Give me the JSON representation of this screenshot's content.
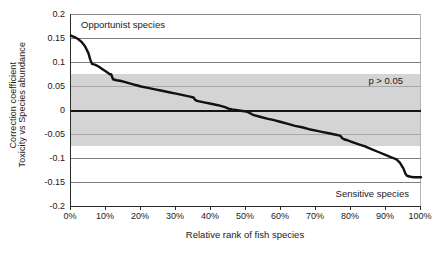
{
  "chart_data": {
    "type": "line",
    "title": "",
    "xlabel": "Relative rank of fish species",
    "ylabel_line1": "Correction coefficient",
    "ylabel_line2": "Toxicity vs Species abundance",
    "xlim": [
      0,
      100
    ],
    "ylim": [
      -0.2,
      0.2
    ],
    "x_ticks": [
      0,
      10,
      20,
      30,
      40,
      50,
      60,
      70,
      80,
      90,
      100
    ],
    "x_tick_labels": [
      "0%",
      "10%",
      "20%",
      "30%",
      "40%",
      "50%",
      "60%",
      "70%",
      "80%",
      "90%",
      "100%"
    ],
    "y_ticks": [
      0.2,
      0.15,
      0.1,
      0.05,
      0,
      -0.05,
      -0.1,
      -0.15,
      -0.2
    ],
    "y_tick_labels": [
      "0.2",
      "0.15",
      "0.1",
      "0.05",
      "0",
      "-0.05",
      "-0.1",
      "-0.15",
      "-0.2"
    ],
    "grid": true,
    "legend": "none",
    "zero_line": 0,
    "shaded_band": {
      "label": "p > 0.05",
      "y_min": -0.075,
      "y_max": 0.075,
      "color": "#d4d4d4"
    },
    "annotations": [
      {
        "text": "Opportunist species",
        "position": "top-left"
      },
      {
        "text": "Sensitive species",
        "position": "bottom-right"
      },
      {
        "text": "p > 0.05",
        "position": "band-right"
      }
    ],
    "series": [
      {
        "name": "Correlation coefficient by rank",
        "color": "#111111",
        "x": [
          0,
          1,
          2,
          3,
          4,
          5,
          5.5,
          6,
          7,
          8,
          9,
          10,
          11,
          11.5,
          12,
          13,
          14,
          15,
          16,
          17,
          18,
          19,
          20,
          22,
          24,
          26,
          28,
          30,
          32,
          34,
          35,
          35.5,
          36,
          38,
          40,
          42,
          43,
          44,
          45,
          46,
          47,
          48,
          49,
          50,
          51,
          52,
          54,
          56,
          58,
          60,
          62,
          64,
          66,
          68,
          70,
          72,
          74,
          76,
          77,
          77.5,
          78,
          79,
          80,
          82,
          84,
          86,
          88,
          90,
          91,
          92,
          93,
          94,
          95,
          95.5,
          96,
          97,
          98,
          99,
          100
        ],
        "y": [
          0.155,
          0.152,
          0.148,
          0.142,
          0.133,
          0.118,
          0.105,
          0.096,
          0.094,
          0.09,
          0.085,
          0.08,
          0.075,
          0.074,
          0.064,
          0.062,
          0.061,
          0.059,
          0.057,
          0.055,
          0.053,
          0.051,
          0.049,
          0.046,
          0.043,
          0.04,
          0.037,
          0.034,
          0.031,
          0.028,
          0.026,
          0.021,
          0.019,
          0.016,
          0.013,
          0.01,
          0.008,
          0.006,
          0.003,
          0.001,
          0.0,
          -0.001,
          -0.002,
          -0.003,
          -0.006,
          -0.01,
          -0.014,
          -0.018,
          -0.021,
          -0.025,
          -0.029,
          -0.033,
          -0.036,
          -0.04,
          -0.043,
          -0.046,
          -0.049,
          -0.052,
          -0.054,
          -0.059,
          -0.061,
          -0.063,
          -0.066,
          -0.071,
          -0.076,
          -0.082,
          -0.088,
          -0.094,
          -0.097,
          -0.1,
          -0.103,
          -0.11,
          -0.122,
          -0.132,
          -0.137,
          -0.139,
          -0.14,
          -0.14,
          -0.14
        ]
      }
    ]
  },
  "axes": {
    "y_title_line1": "Correction coefficient",
    "y_title_line2": "Toxicity vs Species abundance",
    "x_title": "Relative rank of fish species"
  },
  "annotations": {
    "opportunist": "Opportunist species",
    "sensitive": "Sensitive species",
    "pvalue": "p > 0.05"
  },
  "colors": {
    "curve": "#111111",
    "band": "#d4d4d4",
    "grid": "#7d7d7d",
    "axis": "#2b2b2b",
    "zero": "#151515"
  }
}
